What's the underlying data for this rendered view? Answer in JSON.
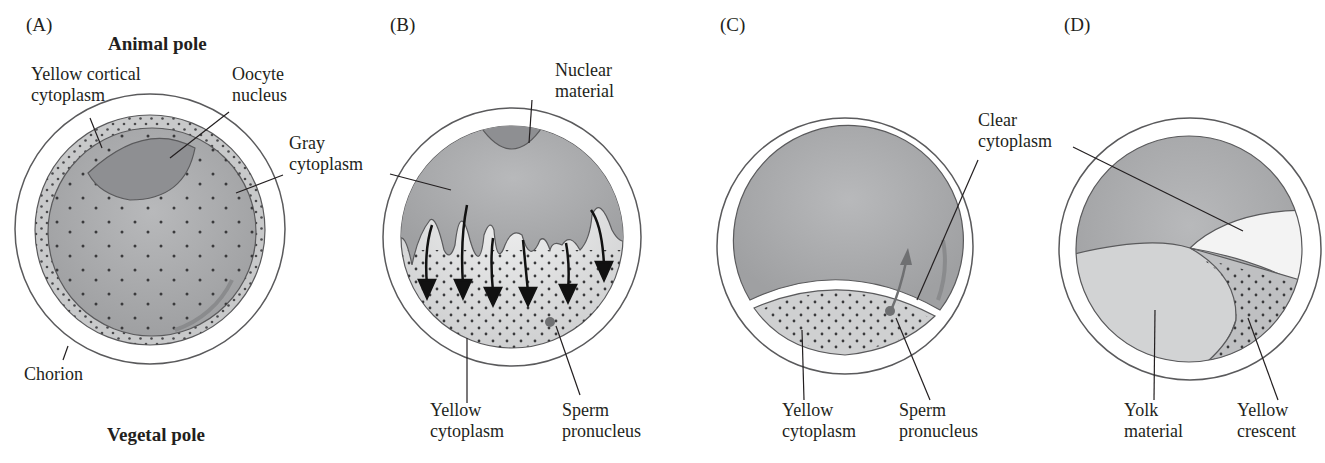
{
  "colors": {
    "gray_cytoplasm": "#a8a9ab",
    "nucleus": "#8e8f92",
    "yellow_cytoplasm": "#d9dadb",
    "clear_cytoplasm": "#f4f4f4",
    "yolk": "#d2d3d4",
    "outline": "#5a5a5c",
    "text": "#231f20"
  },
  "panels": [
    {
      "id": "A",
      "label": "(A)",
      "top_pole": "Animal pole",
      "bottom_pole": "Vegetal pole",
      "callouts": {
        "yellow_cortical_1": "Yellow cortical",
        "yellow_cortical_2": "cytoplasm",
        "oocyte_1": "Oocyte",
        "oocyte_2": "nucleus",
        "gray_1": "Gray",
        "gray_2": "cytoplasm",
        "chorion": "Chorion"
      }
    },
    {
      "id": "B",
      "label": "(B)",
      "callouts": {
        "nuclear_1": "Nuclear",
        "nuclear_2": "material",
        "yellow_1": "Yellow",
        "yellow_2": "cytoplasm",
        "sperm_1": "Sperm",
        "sperm_2": "pronucleus"
      }
    },
    {
      "id": "C",
      "label": "(C)",
      "callouts": {
        "clear_1": "Clear",
        "clear_2": "cytoplasm",
        "yellow_1": "Yellow",
        "yellow_2": "cytoplasm",
        "sperm_1": "Sperm",
        "sperm_2": "pronucleus"
      }
    },
    {
      "id": "D",
      "label": "(D)",
      "callouts": {
        "yolk_1": "Yolk",
        "yolk_2": "material",
        "crescent_1": "Yellow",
        "crescent_2": "crescent"
      }
    }
  ]
}
